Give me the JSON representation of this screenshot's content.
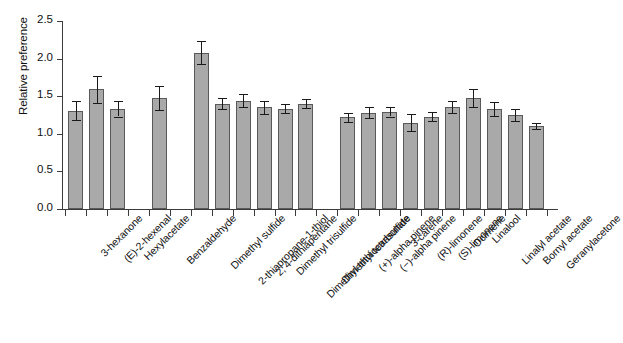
{
  "chart_data": {
    "type": "bar",
    "title": "",
    "xlabel": "",
    "ylabel": "Relative preference",
    "ylim": [
      0.0,
      2.5
    ],
    "ytick_labels": [
      "0.0",
      "0.5",
      "1.0",
      "1.5",
      "2.0",
      "2.5"
    ],
    "ytick_values": [
      0.0,
      0.5,
      1.0,
      1.5,
      2.0,
      2.5
    ],
    "grid": false,
    "legend": "none",
    "error_bars": "standard error",
    "categories": [
      "3-hexanone",
      "(E)-2-hexenal",
      "Hexylacetate",
      "",
      "Benzaldehyde",
      "",
      "Dimethyl sulfide",
      "2-thiapropane-1-thiol",
      "2, 4-dithiapentane",
      "Dimethyl trisulfide",
      "Dimethyl trithiocarbonate",
      "Dimethyl tetrasulfide",
      "",
      "(+)-alpha pinene",
      "(−)-alpha pinene",
      "3-carene",
      "(R)-limonene",
      "(S)-limonene",
      "Ocimene",
      "Linalool",
      "Linalyl acetate",
      "Bornyl acetate",
      "Geranylacetone"
    ],
    "values": [
      1.31,
      1.59,
      1.33,
      null,
      1.48,
      null,
      2.08,
      1.4,
      1.44,
      1.35,
      1.33,
      1.4,
      null,
      1.22,
      1.28,
      1.29,
      1.15,
      1.23,
      1.35,
      1.47,
      1.33,
      1.25,
      1.1
    ],
    "errors": [
      0.13,
      0.18,
      0.1,
      null,
      0.16,
      null,
      0.15,
      0.07,
      0.09,
      0.09,
      0.06,
      0.06,
      null,
      0.06,
      0.07,
      0.06,
      0.11,
      0.06,
      0.08,
      0.12,
      0.09,
      0.08,
      0.04
    ],
    "bar_color": "#a9a9a9",
    "bar_edge_color": "#595959",
    "error_color": "#1a1a1a",
    "axis_color": "#3b3b3b"
  },
  "caption": ""
}
